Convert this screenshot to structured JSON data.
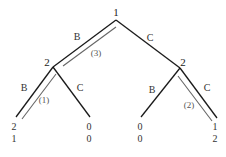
{
  "diagram": {
    "type": "game-tree",
    "nodes": [
      {
        "id": "root",
        "player": "1",
        "x": 116,
        "y": 20,
        "label_x": 116,
        "label_y": 16
      },
      {
        "id": "left",
        "player": "2",
        "x": 53,
        "y": 67,
        "label_x": 47,
        "label_y": 66
      },
      {
        "id": "right",
        "player": "2",
        "x": 180,
        "y": 68,
        "label_x": 183,
        "label_y": 66
      }
    ],
    "leaves": [
      {
        "id": "BB",
        "x": 16,
        "y": 117,
        "payoffs": [
          "2",
          "1"
        ],
        "text_x": 14
      },
      {
        "id": "BC",
        "x": 90,
        "y": 117,
        "payoffs": [
          "0",
          "0"
        ],
        "text_x": 89
      },
      {
        "id": "CB",
        "x": 141,
        "y": 117,
        "payoffs": [
          "0",
          "0"
        ],
        "text_x": 140
      },
      {
        "id": "CC",
        "x": 217,
        "y": 118,
        "payoffs": [
          "1",
          "2"
        ],
        "text_x": 215
      }
    ],
    "edges": [
      {
        "from": "root",
        "to": "left",
        "action": "B",
        "label_x": 77,
        "label_y": 40,
        "highlighted": true,
        "step": "(3)",
        "step_x": 96,
        "step_y": 56
      },
      {
        "from": "root",
        "to": "right",
        "action": "C",
        "label_x": 150,
        "label_y": 41,
        "highlighted": false
      },
      {
        "from": "left",
        "to": "BB",
        "action": "B",
        "label_x": 24,
        "label_y": 91,
        "highlighted": true,
        "step": "(1)",
        "step_x": 44,
        "step_y": 103
      },
      {
        "from": "left",
        "to": "BC",
        "action": "C",
        "label_x": 80,
        "label_y": 91,
        "highlighted": false
      },
      {
        "from": "right",
        "to": "CB",
        "action": "B",
        "label_x": 152,
        "label_y": 93,
        "highlighted": false
      },
      {
        "from": "right",
        "to": "CC",
        "action": "C",
        "label_x": 207,
        "label_y": 91,
        "highlighted": true,
        "step": "(2)",
        "step_x": 189,
        "step_y": 108
      }
    ]
  },
  "labels": {
    "root_player": "1",
    "left_player": "2",
    "right_player": "2",
    "edge_root_left": "B",
    "edge_root_right": "C",
    "edge_left_B": "B",
    "edge_left_C": "C",
    "edge_right_B": "B",
    "edge_right_C": "C",
    "step_1": "(1)",
    "step_2": "(2)",
    "step_3": "(3)",
    "leaf_BB_p1": "2",
    "leaf_BB_p2": "1",
    "leaf_BC_p1": "0",
    "leaf_BC_p2": "0",
    "leaf_CB_p1": "0",
    "leaf_CB_p2": "0",
    "leaf_CC_p1": "1",
    "leaf_CC_p2": "2"
  }
}
